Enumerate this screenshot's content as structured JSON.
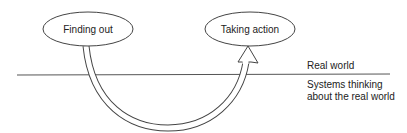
{
  "diagram": {
    "nodes": [
      {
        "id": "finding_out",
        "label": "Finding out"
      },
      {
        "id": "taking_action",
        "label": "Taking action"
      }
    ],
    "arrow": {
      "from": "finding_out",
      "to": "taking_action",
      "style": "double-line curved arrow dipping below divider"
    },
    "divider": {
      "above_label": "Real world",
      "below_label_line1": "Systems thinking",
      "below_label_line2": "about the real world"
    },
    "colors": {
      "stroke": "#333333",
      "text": "#222222",
      "background": "#ffffff"
    }
  }
}
